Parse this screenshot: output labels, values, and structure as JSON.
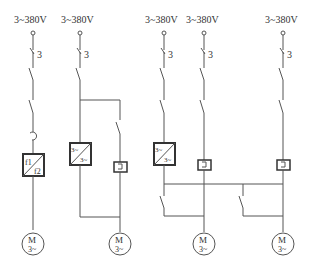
{
  "supplies": [
    {
      "label": "3~380V",
      "fuse_label": "3"
    },
    {
      "label": "3~380V",
      "fuse_label": "3"
    },
    {
      "label": "3~380V",
      "fuse_label": "3"
    },
    {
      "label": "3~380V",
      "fuse_label": "3"
    },
    {
      "label": "3~380V",
      "fuse_label": "3"
    }
  ],
  "frequency_converter": {
    "top": "f1",
    "bottom": "f2"
  },
  "converters": [
    {
      "top": "3~",
      "bottom": "3~"
    },
    {
      "top": "3~",
      "bottom": "3~"
    }
  ],
  "motors": [
    {
      "top": "M",
      "bottom": "3~"
    },
    {
      "top": "M",
      "bottom": "3~"
    },
    {
      "top": "M",
      "bottom": "3~"
    },
    {
      "top": "M",
      "bottom": "3~"
    }
  ]
}
